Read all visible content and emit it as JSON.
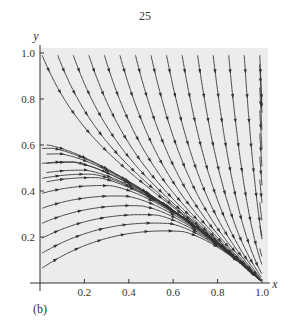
{
  "page_number": "25",
  "panel_label": "(b)",
  "chart_data": {
    "type": "streamplot",
    "title": "",
    "xlabel": "x",
    "ylabel": "y",
    "xlim": [
      0,
      1.0
    ],
    "ylim": [
      0,
      1.0
    ],
    "xticks": [
      0.2,
      0.4,
      0.6,
      0.8,
      1.0
    ],
    "xtick_labels": [
      "0.2",
      "0.4",
      "0.6",
      "0.8",
      "1.0"
    ],
    "yticks": [
      0.2,
      0.4,
      0.6,
      0.8,
      1.0
    ],
    "ytick_labels": [
      "0.2",
      "0.4",
      "0.6",
      "0.8",
      "1.0"
    ],
    "separatrix": {
      "from": [
        0,
        0.62
      ],
      "to": [
        1.0,
        0
      ]
    },
    "stable_point": [
      1.0,
      0
    ],
    "background": "#ececec",
    "line_color": "#333333"
  }
}
